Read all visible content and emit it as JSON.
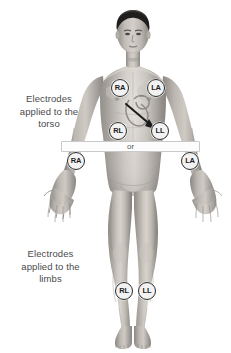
{
  "figure": {
    "background_color": "#ffffff"
  },
  "captions": {
    "torso": "Electrodes\napplied to the\ntorso",
    "limbs": "Electrodes\napplied to the\nlimbs"
  },
  "separator": {
    "label": "or"
  },
  "subject": {
    "description": "Anterior view of a standing adult male with arms extended outward and palms forward",
    "hair_color": "#1f1d1b",
    "skin_color": "#b9b4ae"
  },
  "anatomy": {
    "heart_label": "heart-outline",
    "arrow_label": "arrow-to-ll-electrode"
  },
  "electrodes": [
    {
      "id": "torso-ra",
      "code": "RA",
      "group": "torso",
      "x": 120,
      "y": 88
    },
    {
      "id": "torso-la",
      "code": "LA",
      "group": "torso",
      "x": 156,
      "y": 88
    },
    {
      "id": "torso-rl",
      "code": "RL",
      "group": "torso",
      "x": 118,
      "y": 131
    },
    {
      "id": "torso-ll",
      "code": "LL",
      "group": "torso",
      "x": 160,
      "y": 131
    },
    {
      "id": "limb-ra",
      "code": "RA",
      "group": "limb",
      "x": 76,
      "y": 161
    },
    {
      "id": "limb-la",
      "code": "LA",
      "group": "limb",
      "x": 190,
      "y": 161
    },
    {
      "id": "limb-rl",
      "code": "RL",
      "group": "limb",
      "x": 124,
      "y": 291
    },
    {
      "id": "limb-ll",
      "code": "LL",
      "group": "limb",
      "x": 147,
      "y": 291
    }
  ]
}
